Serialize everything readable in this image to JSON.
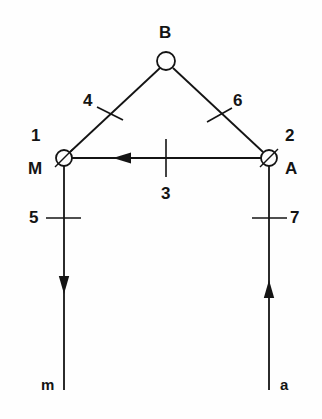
{
  "figure": {
    "title": "",
    "background_color": "#fefefe",
    "stroke_color": "#141414",
    "text_color": "#141414"
  },
  "nodes": [
    {
      "id": "M",
      "label": "M",
      "number": "1",
      "x": 64,
      "y": 158,
      "radius": 8,
      "marker": "slashed-circle",
      "label_pos": "left",
      "number_pos": "upper-left"
    },
    {
      "id": "B",
      "label": "B",
      "number": "",
      "x": 166,
      "y": 61,
      "radius": 9,
      "marker": "open-circle",
      "label_pos": "above",
      "number_pos": ""
    },
    {
      "id": "A",
      "label": "A",
      "number": "2",
      "x": 269,
      "y": 158,
      "radius": 8,
      "marker": "slashed-circle",
      "label_pos": "right",
      "number_pos": "upper-right"
    }
  ],
  "members": [
    {
      "id": "3",
      "label": "3",
      "from": "A",
      "to": "M",
      "orientation": "horizontal",
      "tick": "perpendicular",
      "tick_x": 166,
      "tick_y": 158,
      "arrow": "toward-M",
      "label_x": 166,
      "label_y": 192
    },
    {
      "id": "4",
      "label": "4",
      "from": "M",
      "to": "B",
      "orientation": "diagonal-up-right",
      "tick": "perpendicular",
      "tick_x": 110,
      "tick_y": 113,
      "arrow": "none",
      "label_x": 88,
      "label_y": 102
    },
    {
      "id": "6",
      "label": "6",
      "from": "B",
      "to": "A",
      "orientation": "diagonal-down-right",
      "tick": "perpendicular",
      "tick_x": 219,
      "tick_y": 115,
      "arrow": "none",
      "label_x": 238,
      "label_y": 102
    },
    {
      "id": "5",
      "label": "5",
      "from": "M",
      "to": "m",
      "orientation": "vertical",
      "tick": "perpendicular",
      "tick_x": 64,
      "tick_y": 218,
      "arrow": "down",
      "label_x": 34,
      "label_y": 218
    },
    {
      "id": "7",
      "label": "7",
      "from": "A",
      "to": "a",
      "orientation": "vertical",
      "tick": "perpendicular",
      "tick_x": 269,
      "tick_y": 218,
      "arrow": "up",
      "label_x": 292,
      "label_y": 218
    }
  ],
  "force_labels": [
    {
      "id": "m",
      "label": "m",
      "x": 47,
      "y": 385,
      "attached_to": "5",
      "direction": "down"
    },
    {
      "id": "a",
      "label": "a",
      "x": 285,
      "y": 385,
      "attached_to": "7",
      "direction": "up"
    }
  ],
  "geometry": {
    "left_vertical_top": 158,
    "left_vertical_bottom": 390,
    "right_vertical_top": 158,
    "right_vertical_bottom": 390,
    "left_arrow_tip_y": 294,
    "right_arrow_tip_y": 280,
    "horizontal_arrow_tip_x": 113
  }
}
